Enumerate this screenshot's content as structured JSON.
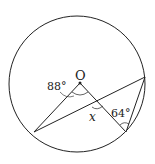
{
  "diagram": {
    "type": "geometry-circle",
    "colors": {
      "stroke": "#222222",
      "background": "#ffffff"
    },
    "circle": {
      "cx": 77,
      "cy": 84,
      "r": 68
    },
    "points": {
      "O": {
        "x": 80,
        "y": 83,
        "label": "O"
      },
      "A": {
        "x": 34,
        "y": 132
      },
      "B": {
        "x": 126,
        "y": 132
      },
      "C": {
        "x": 145,
        "y": 77
      }
    },
    "labels": {
      "center": "O",
      "angle_center": "88°",
      "angle_unknown": "x",
      "angle_chord": "64°"
    }
  }
}
